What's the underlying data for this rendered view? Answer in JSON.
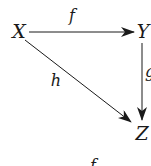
{
  "diagram": {
    "type": "commutative-triangle",
    "nodes": [
      {
        "id": "X",
        "label": "X",
        "x": 19,
        "y": 31
      },
      {
        "id": "Y",
        "label": "Y",
        "x": 143,
        "y": 31
      },
      {
        "id": "Z",
        "label": "Z",
        "x": 142,
        "y": 133
      }
    ],
    "edges": [
      {
        "from": "X",
        "to": "Y",
        "label": "f",
        "label_x": 72,
        "label_y": 16
      },
      {
        "from": "Y",
        "to": "Z",
        "label": "g",
        "label_x": 149,
        "label_y": 72
      },
      {
        "from": "X",
        "to": "Z",
        "label": "h",
        "label_x": 56,
        "label_y": 81
      }
    ],
    "bottom_caption": "f",
    "colors": {
      "ink": "#1a1a1a",
      "background": "#ffffff"
    }
  }
}
